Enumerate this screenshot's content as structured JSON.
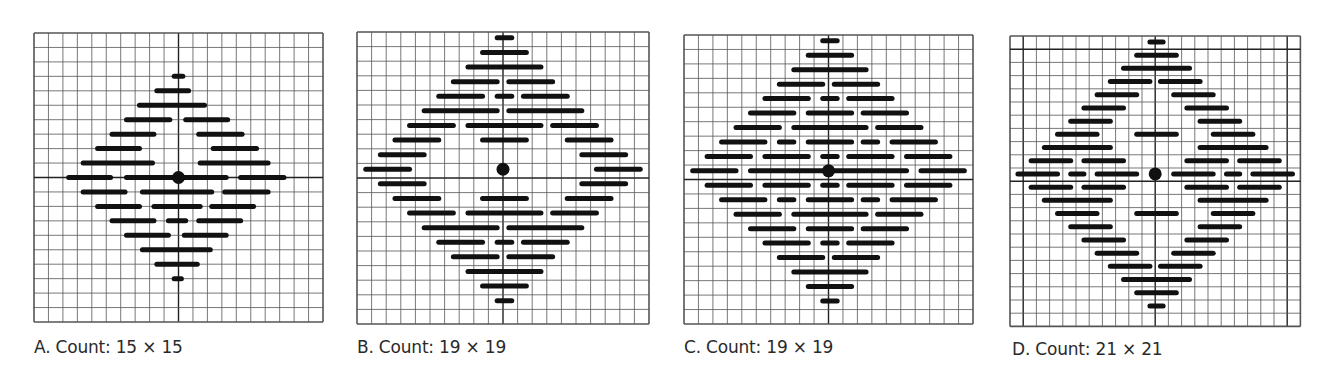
{
  "colors": {
    "grid": "#555555",
    "axis": "#222222",
    "stitch": "#111111",
    "background": "#ffffff",
    "caption": "#2a2a2a"
  },
  "panels": [
    {
      "id": "A",
      "caption": "A. Count: 15 × 15",
      "x": 34,
      "y": 33,
      "cell": 14.45,
      "cols": 20,
      "rows": 20,
      "axis_col": 10,
      "axis_row": 10,
      "caption_x": 34,
      "caption_y": 343,
      "stitches": [
        [
          3,
          [
            [
              9.7,
              10.3
            ]
          ]
        ],
        [
          4,
          [
            [
              8.5,
              10.7
            ]
          ]
        ],
        [
          5,
          [
            [
              7.3,
              11.8
            ]
          ]
        ],
        [
          6,
          [
            [
              6.4,
              9.4
            ],
            [
              10.5,
              13.4
            ]
          ]
        ],
        [
          7,
          [
            [
              5.4,
              8.3
            ],
            [
              11.4,
              14.4
            ]
          ]
        ],
        [
          8,
          [
            [
              4.4,
              7.3
            ],
            [
              12.4,
              15.4
            ]
          ]
        ],
        [
          9,
          [
            [
              3.4,
              8.2
            ],
            [
              11.5,
              16.2
            ]
          ]
        ],
        [
          10,
          [
            [
              2.4,
              5.3
            ],
            [
              6.4,
              13.3
            ],
            [
              14.3,
              17.3
            ]
          ]
        ],
        [
          11,
          [
            [
              3.4,
              6.3
            ],
            [
              7.5,
              12.3
            ],
            [
              13.2,
              16.2
            ]
          ]
        ],
        [
          12,
          [
            [
              4.4,
              7.3
            ],
            [
              8.3,
              11.5
            ],
            [
              12.3,
              15.2
            ]
          ]
        ],
        [
          13,
          [
            [
              5.4,
              8.3
            ],
            [
              9.3,
              10.5
            ],
            [
              11.4,
              14.3
            ]
          ]
        ],
        [
          14,
          [
            [
              6.4,
              9.3
            ],
            [
              10.4,
              13.3
            ]
          ]
        ],
        [
          15,
          [
            [
              7.5,
              12.2
            ]
          ]
        ],
        [
          16,
          [
            [
              8.5,
              11.3
            ]
          ]
        ],
        [
          17,
          [
            [
              9.7,
              10.2
            ]
          ]
        ]
      ],
      "center_dot": [
        10,
        10
      ]
    },
    {
      "id": "B",
      "caption": "B. Count: 19 × 19",
      "x": 357,
      "y": 32,
      "cell": 14.6,
      "cols": 20,
      "rows": 20,
      "axis_col": 10,
      "axis_row": 10,
      "caption_x": 357,
      "caption_y": 343,
      "stitches": [
        [
          0.4,
          [
            [
              9.6,
              10.6
            ]
          ]
        ],
        [
          1.4,
          [
            [
              8.6,
              11.6
            ]
          ]
        ],
        [
          2.4,
          [
            [
              7.6,
              12.6
            ]
          ]
        ],
        [
          3.4,
          [
            [
              6.6,
              9.6
            ],
            [
              10.4,
              13.4
            ]
          ]
        ],
        [
          4.4,
          [
            [
              5.6,
              8.6
            ],
            [
              9.6,
              10.6
            ],
            [
              11.4,
              14.4
            ]
          ]
        ],
        [
          5.4,
          [
            [
              4.6,
              9.6
            ],
            [
              10.4,
              15.4
            ]
          ]
        ],
        [
          6.4,
          [
            [
              3.6,
              6.6
            ],
            [
              7.6,
              12.6
            ],
            [
              13.4,
              16.4
            ]
          ]
        ],
        [
          7.4,
          [
            [
              2.6,
              5.6
            ],
            [
              8.6,
              11.6
            ],
            [
              14.4,
              17.4
            ]
          ]
        ],
        [
          8.4,
          [
            [
              1.6,
              4.6
            ],
            [
              15.4,
              18.4
            ]
          ]
        ],
        [
          9.4,
          [
            [
              0.6,
              3.6
            ],
            [
              16.4,
              19.4
            ]
          ]
        ],
        [
          10.4,
          [
            [
              1.6,
              4.6
            ],
            [
              15.4,
              18.4
            ]
          ]
        ],
        [
          11.4,
          [
            [
              2.6,
              5.6
            ],
            [
              8.6,
              11.6
            ],
            [
              14.4,
              17.4
            ]
          ]
        ],
        [
          12.4,
          [
            [
              3.6,
              6.6
            ],
            [
              7.6,
              12.6
            ],
            [
              13.4,
              16.4
            ]
          ]
        ],
        [
          13.4,
          [
            [
              4.6,
              9.6
            ],
            [
              10.4,
              15.4
            ]
          ]
        ],
        [
          14.4,
          [
            [
              5.6,
              8.6
            ],
            [
              9.6,
              10.6
            ],
            [
              11.4,
              14.4
            ]
          ]
        ],
        [
          15.4,
          [
            [
              6.6,
              9.6
            ],
            [
              10.4,
              13.4
            ]
          ]
        ],
        [
          16.4,
          [
            [
              7.6,
              12.6
            ]
          ]
        ],
        [
          17.4,
          [
            [
              8.6,
              11.6
            ]
          ]
        ],
        [
          18.4,
          [
            [
              9.6,
              10.6
            ]
          ]
        ]
      ],
      "center_dot": [
        10,
        9.4
      ]
    },
    {
      "id": "C",
      "caption": "C. Count: 19 × 19",
      "x": 684,
      "y": 35,
      "cell": 14.45,
      "cols": 20,
      "rows": 20,
      "axis_col": 10,
      "axis_row": 10,
      "caption_x": 684,
      "caption_y": 343,
      "stitches": [
        [
          0.4,
          [
            [
              9.6,
              10.6
            ]
          ]
        ],
        [
          1.4,
          [
            [
              8.6,
              11.6
            ]
          ]
        ],
        [
          2.4,
          [
            [
              7.6,
              12.6
            ]
          ]
        ],
        [
          3.4,
          [
            [
              6.6,
              9.6
            ],
            [
              10.4,
              13.4
            ]
          ]
        ],
        [
          4.4,
          [
            [
              5.6,
              8.6
            ],
            [
              9.6,
              10.6
            ],
            [
              11.4,
              14.4
            ]
          ]
        ],
        [
          5.4,
          [
            [
              4.6,
              7.6
            ],
            [
              8.6,
              11.6
            ],
            [
              12.4,
              15.4
            ]
          ]
        ],
        [
          6.4,
          [
            [
              3.6,
              6.6
            ],
            [
              7.6,
              12.6
            ],
            [
              13.4,
              16.4
            ]
          ]
        ],
        [
          7.4,
          [
            [
              2.6,
              5.6
            ],
            [
              6.6,
              7.6
            ],
            [
              8.6,
              11.6
            ],
            [
              12.4,
              13.4
            ],
            [
              14.4,
              17.4
            ]
          ]
        ],
        [
          8.4,
          [
            [
              1.6,
              4.6
            ],
            [
              5.6,
              8.6
            ],
            [
              9.6,
              10.6
            ],
            [
              11.4,
              14.4
            ],
            [
              15.4,
              18.4
            ]
          ]
        ],
        [
          9.4,
          [
            [
              0.6,
              3.6
            ],
            [
              4.6,
              15.4
            ],
            [
              16.4,
              19.4
            ]
          ]
        ],
        [
          10.4,
          [
            [
              1.6,
              4.6
            ],
            [
              5.6,
              8.6
            ],
            [
              9.6,
              10.6
            ],
            [
              11.4,
              14.4
            ],
            [
              15.4,
              18.4
            ]
          ]
        ],
        [
          11.4,
          [
            [
              2.6,
              5.6
            ],
            [
              6.6,
              7.6
            ],
            [
              8.6,
              11.6
            ],
            [
              12.4,
              13.4
            ],
            [
              14.4,
              17.4
            ]
          ]
        ],
        [
          12.4,
          [
            [
              3.6,
              6.6
            ],
            [
              7.6,
              12.6
            ],
            [
              13.4,
              16.4
            ]
          ]
        ],
        [
          13.4,
          [
            [
              4.6,
              7.6
            ],
            [
              8.6,
              11.6
            ],
            [
              12.4,
              15.4
            ]
          ]
        ],
        [
          14.4,
          [
            [
              5.6,
              8.6
            ],
            [
              9.6,
              10.6
            ],
            [
              11.4,
              14.4
            ]
          ]
        ],
        [
          15.4,
          [
            [
              6.6,
              9.6
            ],
            [
              10.4,
              13.4
            ]
          ]
        ],
        [
          16.4,
          [
            [
              7.6,
              12.6
            ]
          ]
        ],
        [
          17.4,
          [
            [
              8.6,
              11.6
            ]
          ]
        ],
        [
          18.4,
          [
            [
              9.6,
              10.6
            ]
          ]
        ]
      ],
      "center_dot": [
        10,
        9.4
      ]
    },
    {
      "id": "D",
      "caption": "D. Count: 21 × 21",
      "x": 1010,
      "y": 36,
      "cell": 13.2,
      "cols": 22,
      "rows": 22,
      "axis_col": 11,
      "axis_row": 11,
      "bold_lines": {
        "cols": [
          1,
          21
        ],
        "rows": [
          1
        ]
      },
      "caption_x": 1012,
      "caption_y": 345,
      "stitches": [
        [
          0.45,
          [
            [
              10.6,
              11.6
            ]
          ]
        ],
        [
          1.45,
          [
            [
              9.6,
              12.6
            ]
          ]
        ],
        [
          2.45,
          [
            [
              8.6,
              13.6
            ]
          ]
        ],
        [
          3.45,
          [
            [
              7.6,
              10.6
            ],
            [
              11.4,
              14.4
            ]
          ]
        ],
        [
          4.45,
          [
            [
              6.6,
              9.6
            ],
            [
              12.4,
              15.4
            ]
          ]
        ],
        [
          5.45,
          [
            [
              5.6,
              8.6
            ],
            [
              13.4,
              16.4
            ]
          ]
        ],
        [
          6.45,
          [
            [
              4.6,
              7.6
            ],
            [
              14.4,
              17.4
            ]
          ]
        ],
        [
          7.45,
          [
            [
              3.6,
              6.6
            ],
            [
              9.6,
              12.6
            ],
            [
              15.4,
              18.4
            ]
          ]
        ],
        [
          8.45,
          [
            [
              2.6,
              7.6
            ],
            [
              14.4,
              19.4
            ]
          ]
        ],
        [
          9.45,
          [
            [
              1.6,
              4.6
            ],
            [
              5.6,
              8.6
            ],
            [
              13.4,
              16.4
            ],
            [
              17.4,
              20.4
            ]
          ]
        ],
        [
          10.45,
          [
            [
              0.6,
              3.6
            ],
            [
              4.6,
              5.6
            ],
            [
              6.6,
              9.6
            ],
            [
              12.4,
              15.4
            ],
            [
              16.4,
              17.4
            ],
            [
              18.4,
              21.4
            ]
          ]
        ],
        [
          11.45,
          [
            [
              1.6,
              4.6
            ],
            [
              5.6,
              8.6
            ],
            [
              13.4,
              16.4
            ],
            [
              17.4,
              20.4
            ]
          ]
        ],
        [
          12.45,
          [
            [
              2.6,
              7.6
            ],
            [
              14.4,
              19.4
            ]
          ]
        ],
        [
          13.45,
          [
            [
              3.6,
              6.6
            ],
            [
              9.6,
              12.6
            ],
            [
              15.4,
              18.4
            ]
          ]
        ],
        [
          14.45,
          [
            [
              4.6,
              7.6
            ],
            [
              14.4,
              17.4
            ]
          ]
        ],
        [
          15.45,
          [
            [
              5.6,
              8.6
            ],
            [
              13.4,
              16.4
            ]
          ]
        ],
        [
          16.45,
          [
            [
              6.6,
              9.6
            ],
            [
              12.4,
              15.4
            ]
          ]
        ],
        [
          17.45,
          [
            [
              7.6,
              10.6
            ],
            [
              11.4,
              14.4
            ]
          ]
        ],
        [
          18.45,
          [
            [
              8.6,
              13.6
            ]
          ]
        ],
        [
          19.45,
          [
            [
              9.6,
              12.6
            ]
          ]
        ],
        [
          20.45,
          [
            [
              10.6,
              11.6
            ]
          ]
        ]
      ],
      "center_dot": [
        11,
        10.45
      ]
    }
  ]
}
